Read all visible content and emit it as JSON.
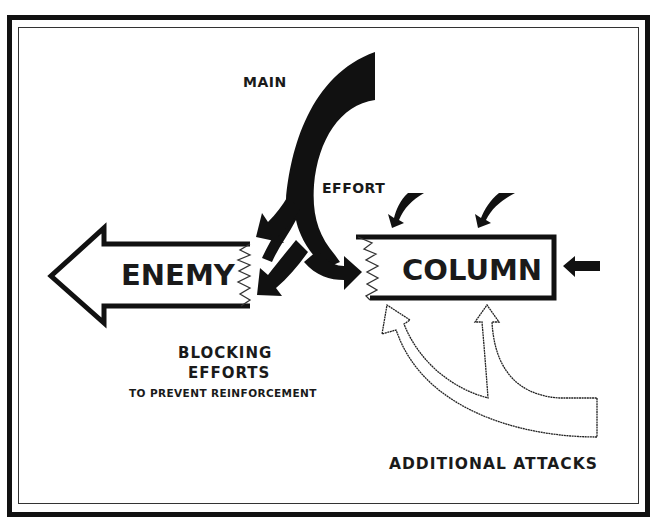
{
  "diagram": {
    "labels": {
      "main": "MAIN",
      "effort": "EFFORT",
      "enemy": "ENEMY",
      "column": "COLUMN",
      "blocking": "BLOCKING",
      "efforts": "EFFORTS",
      "prevent": "TO PREVENT REINFORCEMENT",
      "additional_attacks": "ADDITIONAL ATTACKS"
    },
    "elements": [
      {
        "id": "enemy-column-arrow",
        "shape": "hollow-arrow",
        "direction": "left",
        "label": "ENEMY"
      },
      {
        "id": "column-box",
        "shape": "hollow-box-torn-left",
        "label": "COLUMN"
      },
      {
        "id": "main-effort-arrow",
        "shape": "black-curved-arrow",
        "branches": 3,
        "targets": [
          "enemy (blocking)",
          "enemy (blocking)",
          "column"
        ]
      },
      {
        "id": "additional-attacks-arrow",
        "shape": "white-curved-split-arrow",
        "branches": 2,
        "target": "column"
      },
      {
        "id": "small-attack-arrows",
        "shape": "black-small-arrows",
        "count": 3,
        "target": "column"
      }
    ],
    "colors": {
      "ink": "#111111",
      "paper": "#ffffff"
    }
  }
}
